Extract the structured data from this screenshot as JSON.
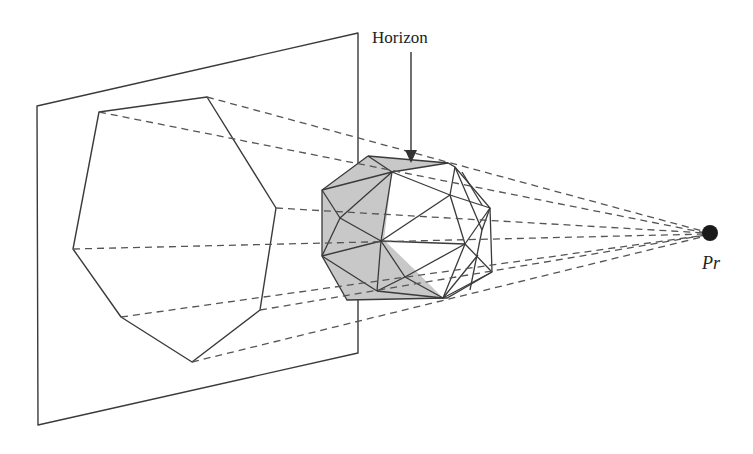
{
  "diagram": {
    "type": "perspective projection of polyhedron silhouette onto plane",
    "labels": {
      "horizon": "Horizon",
      "projection_point": "Pr"
    },
    "elements": [
      {
        "name": "projection-plane",
        "shape": "parallelogram"
      },
      {
        "name": "silhouette-polygon",
        "shape": "heptagon",
        "vertices": 7
      },
      {
        "name": "polyhedron",
        "shape": "triangulated sphere",
        "shaded_region": "horizon-facing faces"
      },
      {
        "name": "projection-rays",
        "style": "dashed",
        "count": 7
      },
      {
        "name": "horizon-arrow",
        "points_to": "horizon edge"
      },
      {
        "name": "projection-point",
        "shape": "filled circle"
      }
    ],
    "colors": {
      "stroke": "#3a3a3a",
      "shade": "#c8c8c8",
      "background": "#ffffff"
    }
  }
}
